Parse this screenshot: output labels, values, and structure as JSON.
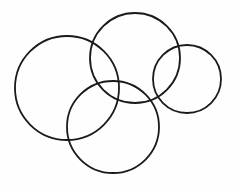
{
  "diagram": {
    "type": "overlapping-circles",
    "background": "#fefefe",
    "stroke_color": "#1a1a1a",
    "stroke_width": 1.8,
    "circles": [
      {
        "id": "left-large",
        "cx": 67,
        "cy": 88,
        "r": 52
      },
      {
        "id": "top-middle",
        "cx": 135,
        "cy": 58,
        "r": 45
      },
      {
        "id": "right-small",
        "cx": 187,
        "cy": 79,
        "r": 34
      },
      {
        "id": "bottom-middle",
        "cx": 113,
        "cy": 127,
        "r": 46
      }
    ]
  }
}
